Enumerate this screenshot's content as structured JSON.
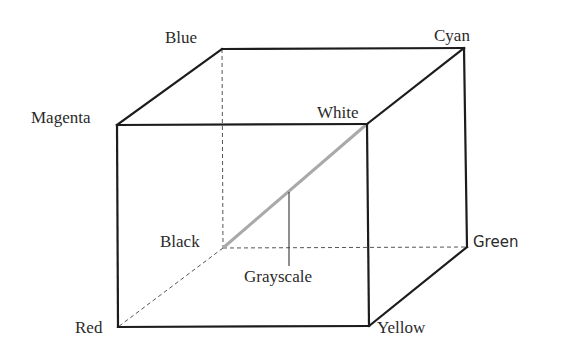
{
  "diagram": {
    "vertices": {
      "blue": {
        "label": "Blue"
      },
      "cyan": {
        "label": "Cyan"
      },
      "magenta": {
        "label": "Magenta"
      },
      "white": {
        "label": "White"
      },
      "black": {
        "label": "Black"
      },
      "green": {
        "label": "Green"
      },
      "red": {
        "label": "Red"
      },
      "yellow": {
        "label": "Yellow"
      }
    },
    "annotations": {
      "grayscale": {
        "label": "Grayscale",
        "points_to": "black-white diagonal"
      }
    },
    "edges": {
      "solid": [
        [
          "magenta",
          "blue"
        ],
        [
          "blue",
          "cyan"
        ],
        [
          "magenta",
          "white"
        ],
        [
          "white",
          "cyan"
        ],
        [
          "magenta",
          "red"
        ],
        [
          "red",
          "yellow"
        ],
        [
          "white",
          "yellow"
        ],
        [
          "cyan",
          "green"
        ],
        [
          "yellow",
          "green"
        ]
      ],
      "hidden": [
        [
          "blue",
          "black"
        ],
        [
          "black",
          "green"
        ],
        [
          "black",
          "red"
        ]
      ],
      "diagonal": [
        "black",
        "white"
      ]
    },
    "colors": {
      "edge": "#1c1c1c",
      "hidden_edge": "#555555",
      "grayscale_diagonal": "#a9a9a9",
      "text": "#2a2a2a",
      "background": "#ffffff"
    }
  }
}
